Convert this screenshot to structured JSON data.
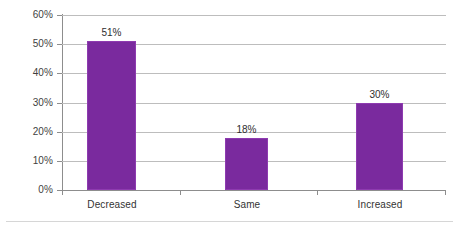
{
  "chart_data": {
    "type": "bar",
    "title": "",
    "subtitle": "",
    "xlabel": "",
    "ylabel": "",
    "categories": [
      "Decreased",
      "Same",
      "Increased"
    ],
    "values": [
      51,
      18,
      30
    ],
    "value_labels": [
      "51%",
      "18%",
      "30%"
    ],
    "ylim": [
      0,
      60
    ],
    "ytick_labels": [
      "60%",
      "50%",
      "40%",
      "30%",
      "20%",
      "10%",
      "0%"
    ],
    "ytick_values": [
      60,
      50,
      40,
      30,
      20,
      10,
      0
    ],
    "grid": true,
    "legend": "none",
    "series": [
      {
        "name": "",
        "values": [
          51,
          18,
          30
        ]
      }
    ]
  },
  "style": {
    "bar_color": "#7a2a9e",
    "bar_border_color": "#8e3bb0",
    "gridline_color": "#bdbdbd",
    "axis_color": "#8d8d8d",
    "label_color": "#333333",
    "background": "#ffffff"
  }
}
